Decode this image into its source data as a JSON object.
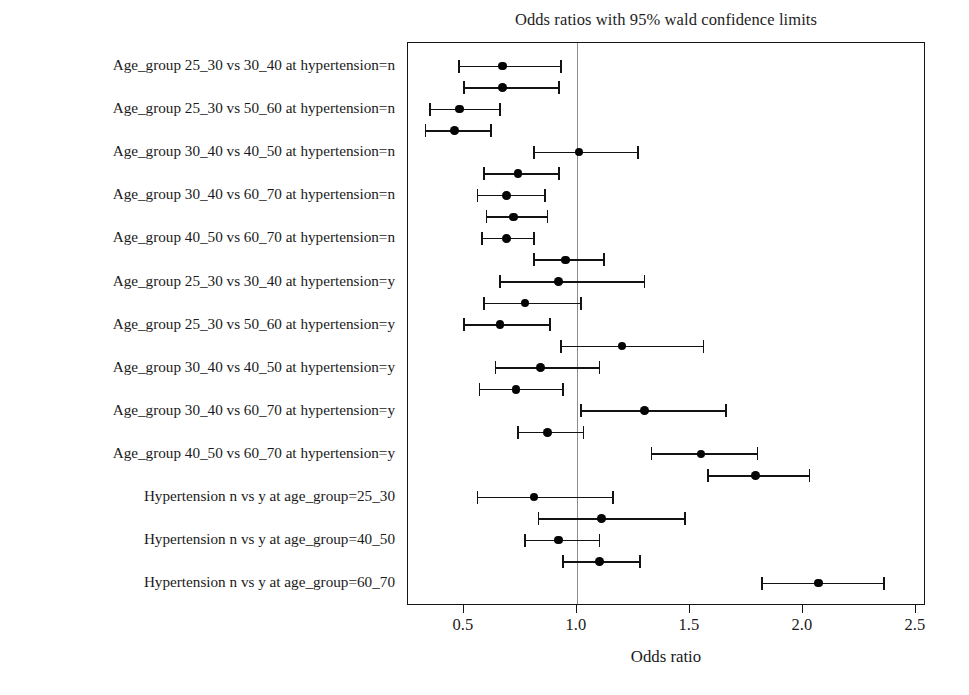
{
  "chart_data": {
    "type": "scatter",
    "title": "Odds ratios with 95% wald confidence limits",
    "xlabel": "Odds ratio",
    "ylabel": "",
    "xlim": [
      0.253,
      2.545
    ],
    "xticks": [
      0.5,
      1.0,
      1.5,
      2.0,
      2.5
    ],
    "xticklabels": [
      "0.5",
      "1.0",
      "1.5",
      "2.0",
      "2.5"
    ],
    "grid": false,
    "legend": null,
    "reference_line": 1.0,
    "categories": [
      "Age_group 25_30 vs 30_40 at hypertension=n",
      "Age_group 25_30 vs 50_60 at hypertension=n",
      "Age_group 30_40 vs 40_50 at hypertension=n",
      "Age_group 30_40 vs 60_70 at hypertension=n",
      "Age_group 40_50 vs 60_70 at hypertension=n",
      "Age_group 25_30 vs 30_40 at hypertension=y",
      "Age_group 25_30 vs 50_60 at hypertension=y",
      "Age_group 30_40 vs 40_50 at hypertension=y",
      "Age_group 30_40 vs 60_70 at hypertension=y",
      "Age_group 40_50 vs 60_70 at hypertension=y",
      "Hypertension n vs y at age_group=25_30",
      "Hypertension n vs y at age_group=40_50",
      "Hypertension n vs y at age_group=60_70"
    ],
    "points": [
      {
        "index": 1,
        "estimate": 0.67,
        "lower": 0.48,
        "upper": 0.93
      },
      {
        "index": 2,
        "estimate": 0.67,
        "lower": 0.5,
        "upper": 0.92
      },
      {
        "index": 3,
        "estimate": 0.48,
        "lower": 0.35,
        "upper": 0.66
      },
      {
        "index": 4,
        "estimate": 0.46,
        "lower": 0.33,
        "upper": 0.62
      },
      {
        "index": 5,
        "estimate": 1.01,
        "lower": 0.81,
        "upper": 1.27
      },
      {
        "index": 6,
        "estimate": 0.74,
        "lower": 0.59,
        "upper": 0.92
      },
      {
        "index": 7,
        "estimate": 0.69,
        "lower": 0.56,
        "upper": 0.86
      },
      {
        "index": 8,
        "estimate": 0.72,
        "lower": 0.6,
        "upper": 0.87
      },
      {
        "index": 9,
        "estimate": 0.69,
        "lower": 0.58,
        "upper": 0.81
      },
      {
        "index": 10,
        "estimate": 0.95,
        "lower": 0.81,
        "upper": 1.12
      },
      {
        "index": 11,
        "estimate": 0.92,
        "lower": 0.66,
        "upper": 1.3
      },
      {
        "index": 12,
        "estimate": 0.77,
        "lower": 0.59,
        "upper": 1.02
      },
      {
        "index": 13,
        "estimate": 0.66,
        "lower": 0.5,
        "upper": 0.88
      },
      {
        "index": 14,
        "estimate": 1.2,
        "lower": 0.93,
        "upper": 1.56
      },
      {
        "index": 15,
        "estimate": 0.84,
        "lower": 0.64,
        "upper": 1.1
      },
      {
        "index": 16,
        "estimate": 0.73,
        "lower": 0.57,
        "upper": 0.94
      },
      {
        "index": 17,
        "estimate": 1.3,
        "lower": 1.02,
        "upper": 1.66
      },
      {
        "index": 18,
        "estimate": 0.87,
        "lower": 0.74,
        "upper": 1.03
      },
      {
        "index": 19,
        "estimate": 1.55,
        "lower": 1.33,
        "upper": 1.8
      },
      {
        "index": 20,
        "estimate": 1.79,
        "lower": 1.58,
        "upper": 2.03
      },
      {
        "index": 21,
        "estimate": 0.81,
        "lower": 0.56,
        "upper": 1.16
      },
      {
        "index": 22,
        "estimate": 1.11,
        "lower": 0.83,
        "upper": 1.48
      },
      {
        "index": 23,
        "estimate": 0.92,
        "lower": 0.77,
        "upper": 1.1
      },
      {
        "index": 24,
        "estimate": 1.1,
        "lower": 0.94,
        "upper": 1.28
      },
      {
        "index": 25,
        "estimate": 2.07,
        "lower": 1.82,
        "upper": 2.36
      }
    ]
  }
}
